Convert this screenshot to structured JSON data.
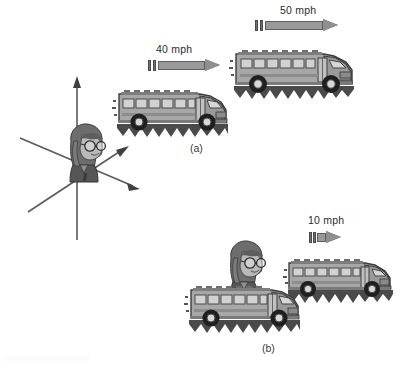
{
  "figure": {
    "background_color": "#ffffff",
    "ink_color": "#2b2b2b"
  },
  "panels": [
    {
      "id": "a",
      "label": "(a)",
      "caption_x": 190,
      "caption_y": 143,
      "description": "Two buses moving right as seen from the ground reference frame",
      "vectors": [
        {
          "name": "velocity-40mph",
          "label": "40 mph",
          "value": 40,
          "unit": "mph",
          "direction": "right",
          "x": 148,
          "y": 59,
          "length": 72,
          "label_x": 156,
          "label_y": 44
        },
        {
          "name": "velocity-50mph",
          "label": "50 mph",
          "value": 50,
          "unit": "mph",
          "direction": "right",
          "x": 255,
          "y": 19,
          "length": 86,
          "label_x": 280,
          "label_y": 5
        }
      ],
      "buses": [
        {
          "name": "bus-front-40mph",
          "x": 112,
          "y": 76,
          "width": 124,
          "height": 68
        },
        {
          "name": "bus-rear-50mph",
          "x": 228,
          "y": 34,
          "width": 134,
          "height": 74
        }
      ]
    },
    {
      "id": "b",
      "label": "(b)",
      "caption_x": 262,
      "caption_y": 343,
      "description": "Relative motion: one bus seen from the other bus reference frame",
      "vectors": [
        {
          "name": "velocity-10mph",
          "label": "10 mph",
          "value": 10,
          "unit": "mph",
          "direction": "right",
          "x": 309,
          "y": 231,
          "length": 32,
          "label_x": 308,
          "label_y": 215
        }
      ],
      "buses": [
        {
          "name": "bus-observer",
          "x": 184,
          "y": 272,
          "width": 124,
          "height": 68
        },
        {
          "name": "bus-ahead-10mph",
          "x": 283,
          "y": 246,
          "width": 116,
          "height": 64
        }
      ],
      "observer": {
        "name": "observer-girl-panel-b",
        "x": 218,
        "y": 238,
        "width": 52,
        "height": 62
      }
    }
  ],
  "coordinate_system": {
    "name": "reference-frame-axes",
    "origin_x": 77,
    "origin_y": 163,
    "axes": [
      {
        "name": "axis-vertical",
        "label": "",
        "to_x": 77,
        "to_y": 78
      },
      {
        "name": "axis-diagonal-upper",
        "label": "",
        "to_x": 122,
        "to_y": 150
      },
      {
        "name": "axis-diagonal-lower",
        "label": "",
        "to_x": 133,
        "to_y": 186
      }
    ],
    "observer": {
      "name": "observer-girl-axes",
      "x": 58,
      "y": 121,
      "width": 50,
      "height": 60
    }
  }
}
